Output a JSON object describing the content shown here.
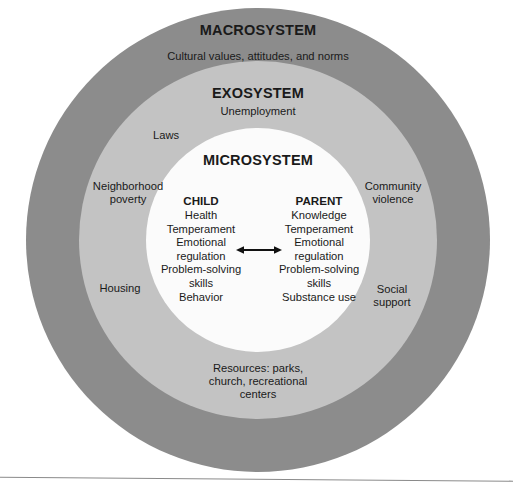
{
  "diagram": {
    "colors": {
      "macrosystem_ring": "#8c8c8c",
      "exosystem_ring": "#c3c3c3",
      "microsystem_circle": "#fbfbfb",
      "text": "#1a1a1a",
      "rule": "#8a8a8a"
    },
    "macrosystem": {
      "heading": "MACROSYSTEM",
      "subtitle": "Cultural values, attitudes, and norms"
    },
    "exosystem": {
      "heading": "EXOSYSTEM",
      "subtitle": "Unemployment",
      "labels": {
        "laws": "Laws",
        "neighborhood_poverty_line1": "Neighborhood",
        "neighborhood_poverty_line2": "poverty",
        "housing": "Housing",
        "community_violence_line1": "Community",
        "community_violence_line2": "violence",
        "social_support_line1": "Social",
        "social_support_line2": "support",
        "resources_line1": "Resources: parks,",
        "resources_line2": "church, recreational",
        "resources_line3": "centers"
      }
    },
    "microsystem": {
      "heading": "MICROSYSTEM",
      "child": {
        "heading": "CHILD",
        "items": [
          "Health",
          "Temperament",
          "Emotional",
          "regulation",
          "Problem-solving",
          "skills",
          "Behavior"
        ]
      },
      "parent": {
        "heading": "PARENT",
        "items": [
          "Knowledge",
          "Temperament",
          "Emotional",
          "regulation",
          "Problem-solving",
          "skills",
          "Substance use"
        ]
      },
      "relation_icon": "double-headed-arrow"
    }
  }
}
